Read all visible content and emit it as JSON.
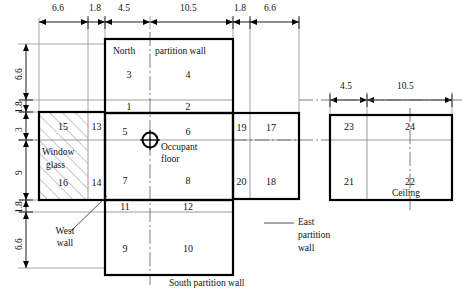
{
  "figure": {
    "type": "technical-diagram"
  },
  "dimensions": {
    "top_chain": [
      "6.6",
      "1.8",
      "4.5",
      "10.5",
      "1.8",
      "6.6"
    ],
    "left_chain": [
      "6.6",
      "1.8",
      "3",
      "9",
      "1.8",
      "6.6"
    ],
    "ceiling_chain": [
      "4.5",
      "10.5"
    ]
  },
  "panels": {
    "north": {
      "title_left": "North",
      "title_right": "partition wall",
      "cells": [
        "3",
        "4",
        "1",
        "2"
      ]
    },
    "floor": {
      "label": "Occupant",
      "label2": "floor",
      "cells": [
        "5",
        "6",
        "7",
        "8"
      ]
    },
    "east": {
      "label_l1": "East",
      "label_l2": "partition",
      "label_l3": "wall",
      "cells": [
        "19",
        "17",
        "20",
        "18"
      ]
    },
    "south": {
      "label": "South partition wall",
      "cells": [
        "11",
        "12",
        "9",
        "10"
      ]
    },
    "west": {
      "label_l1": "Window",
      "label_l2": "glass",
      "wall_l1": "West",
      "wall_l2": "wall",
      "cells": [
        "15",
        "13",
        "16",
        "14"
      ]
    },
    "ceiling": {
      "label": "Ceiling",
      "cells": [
        "23",
        "24",
        "21",
        "22"
      ]
    }
  },
  "colors": {
    "stroke_heavy": "#000000",
    "stroke_light": "#808080",
    "hatch": "#8a8a8a",
    "background": "#ffffff"
  }
}
